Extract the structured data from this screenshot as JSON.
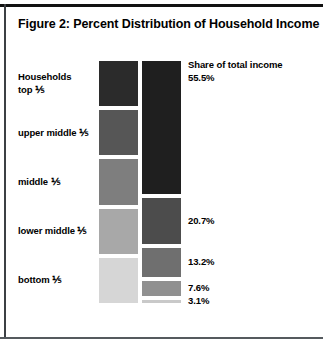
{
  "figure": {
    "title": "Figure 2: Percent Distribution of Household Income",
    "households_header": "Households",
    "share_header": "Share of total income"
  },
  "chart_data": {
    "type": "bar",
    "title": "Figure 2: Percent Distribution of Household Income",
    "xlabel": "",
    "ylabel": "",
    "orientation": "vertical-stacked",
    "categories": [
      "top ⅕",
      "upper middle ⅕",
      "middle ⅕",
      "lower middle ⅕",
      "bottom ⅕"
    ],
    "series": [
      {
        "name": "Households",
        "label": "Households",
        "values": [
          20.0,
          20.0,
          20.0,
          20.0,
          20.0
        ],
        "value_labels": [
          "",
          "",
          "",
          "",
          ""
        ]
      },
      {
        "name": "Share of total income",
        "label": "Share of total income",
        "values": [
          55.5,
          20.7,
          13.2,
          7.6,
          3.1
        ],
        "value_labels": [
          "55.5%",
          "20.7%",
          "13.2%",
          "7.6%",
          "3.1%"
        ]
      }
    ],
    "ylim": [
      0,
      100
    ],
    "grid": false,
    "legend": "none",
    "segment_colors_households": [
      "#2b2b2b",
      "#565656",
      "#7e7e7e",
      "#a8a8a8",
      "#d6d6d6"
    ],
    "segment_colors_income": [
      "#1f1f1f",
      "#4c4c4c",
      "#6f6f6f",
      "#909090",
      "#c9c9c9"
    ]
  },
  "rows": [
    {
      "label_line1": "Households",
      "label_line2": "top ⅕",
      "share": "55.5%",
      "households_pct": 20.0,
      "income_pct": 55.5
    },
    {
      "label_line1": "",
      "label_line2": "upper middle ⅕",
      "share": "20.7%",
      "households_pct": 20.0,
      "income_pct": 20.7
    },
    {
      "label_line1": "",
      "label_line2": "middle ⅕",
      "share": "13.2%",
      "households_pct": 20.0,
      "income_pct": 13.2
    },
    {
      "label_line1": "",
      "label_line2": "lower middle ⅕",
      "share": "7.6%",
      "households_pct": 20.0,
      "income_pct": 7.6
    },
    {
      "label_line1": "",
      "label_line2": "bottom ⅕",
      "share": "3.1%",
      "households_pct": 20.0,
      "income_pct": 3.1
    }
  ],
  "colors": {
    "ink": "#000000",
    "rule": "#111111",
    "background": "#ffffff"
  }
}
